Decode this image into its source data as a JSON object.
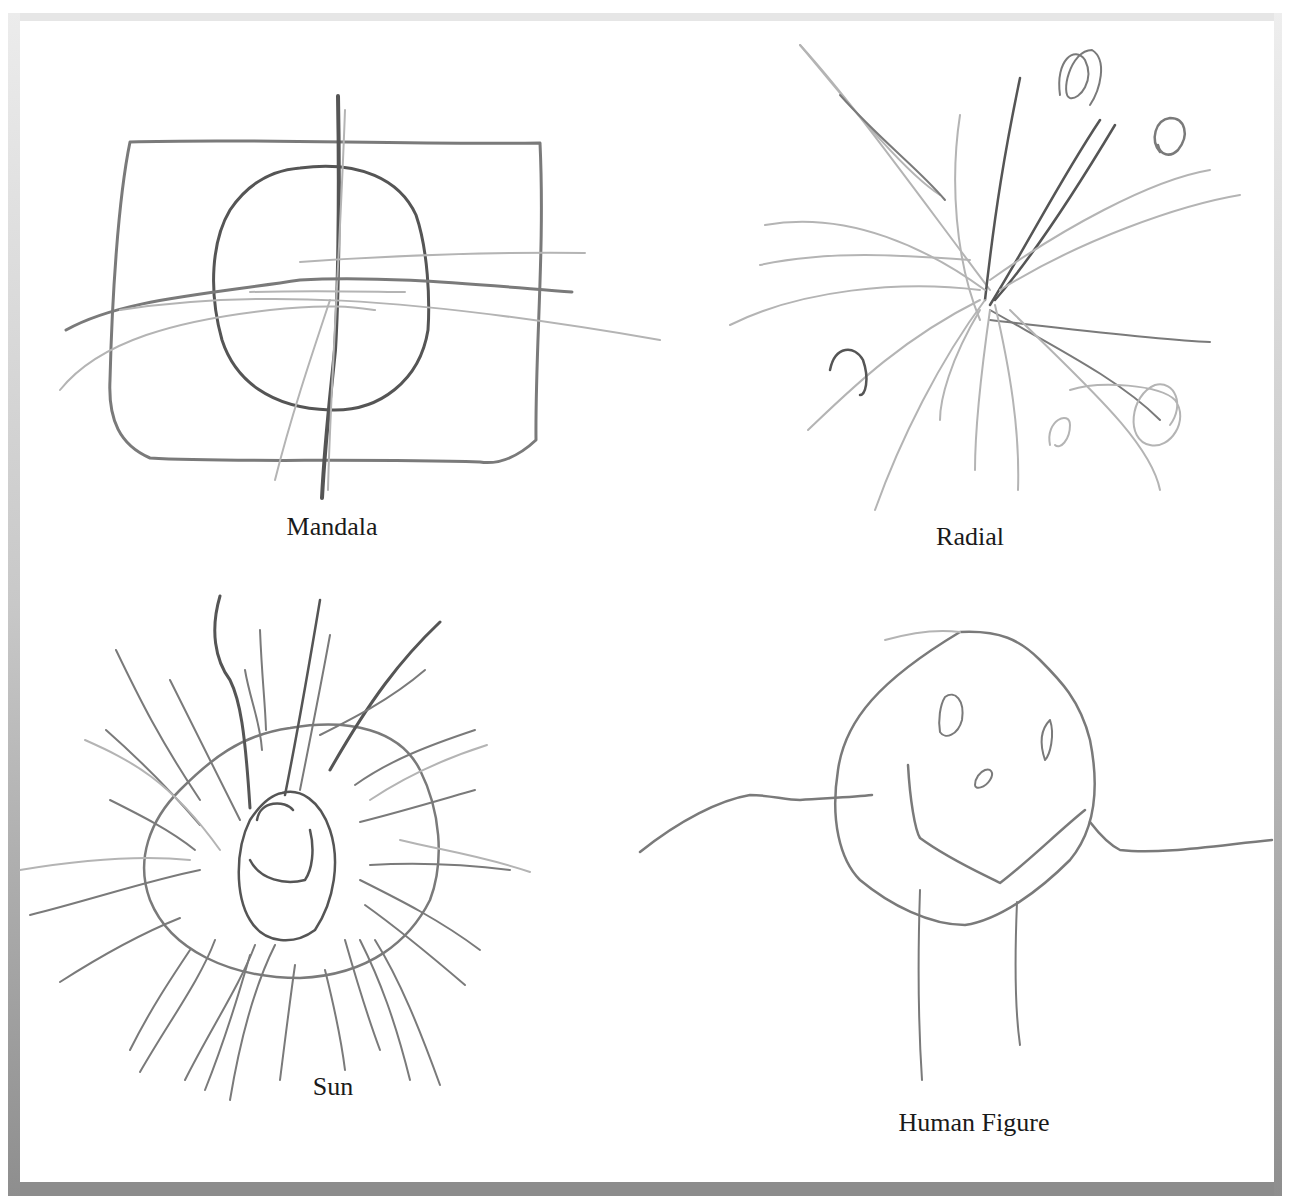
{
  "figure": {
    "panels": [
      {
        "id": "mandala",
        "caption": "Mandala"
      },
      {
        "id": "radial",
        "caption": "Radial"
      },
      {
        "id": "sun",
        "caption": "Sun"
      },
      {
        "id": "human-figure",
        "caption": "Human Figure"
      }
    ],
    "colors": {
      "pencil_dark": "#555555",
      "pencil_mid": "#7a7a7a",
      "pencil_light": "#b4b4b4",
      "frame_top": "#e6e6e6",
      "frame_bottom": "#8c8c8c",
      "paper": "#ffffff"
    }
  }
}
